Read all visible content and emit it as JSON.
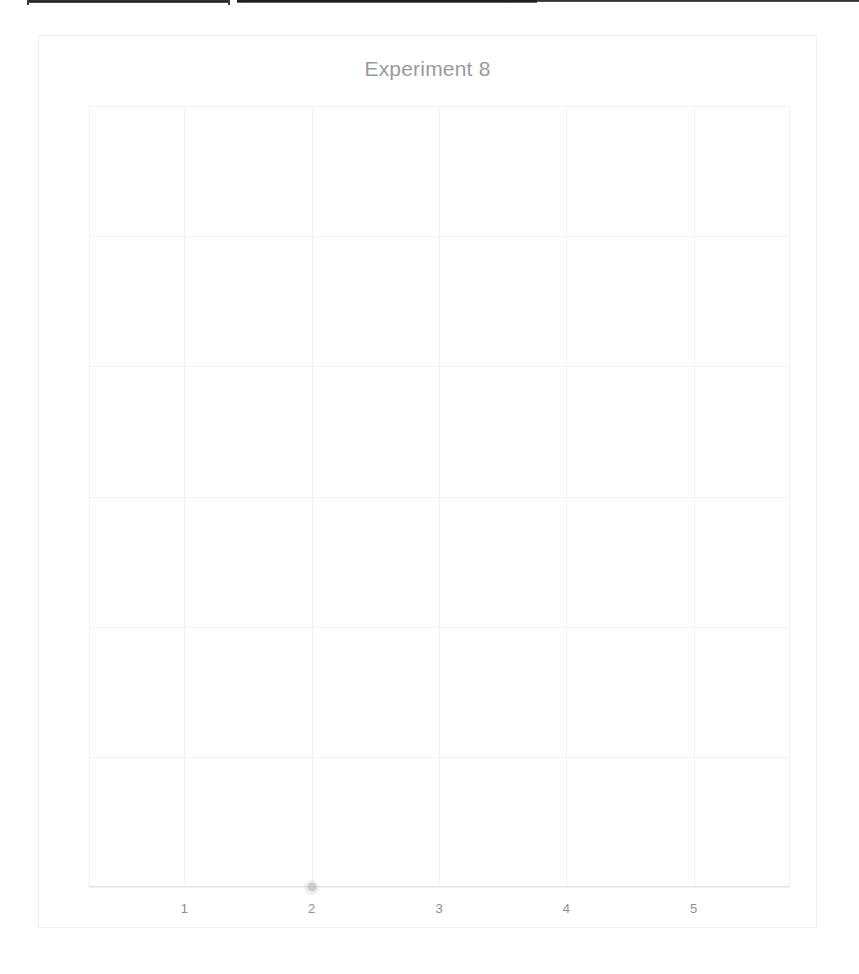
{
  "page": {
    "background_color": "#ffffff",
    "width": 859,
    "height": 974
  },
  "scan_artifacts": {
    "bar_left_label": "",
    "bar_right_label": ""
  },
  "chart_data": {
    "type": "scatter",
    "title": "Experiment 8",
    "xlabel": "",
    "ylabel": "",
    "xticklabels": [
      "1",
      "2",
      "3",
      "4",
      "5"
    ],
    "x": [
      2
    ],
    "y": [
      0
    ],
    "yticklabels": [],
    "xlim": [
      0.25,
      5.75
    ],
    "ylim": [
      0,
      6.7
    ],
    "grid": true,
    "grid_color": "#f2f2f4",
    "legend": false,
    "marker_color": "#b4b4b8",
    "title_color": "#9a9a9e",
    "tick_color": "#8e8e92",
    "frame_color": "#f0f0f2",
    "axis_color": "#e2e2e6",
    "series": [
      {
        "name": "",
        "points": [
          {
            "x": 2,
            "y": 0
          }
        ]
      }
    ],
    "x_gridline_values": [
      0.25,
      1,
      2,
      3,
      4,
      5,
      5.75
    ],
    "y_gridline_count": 7,
    "note": "Heavily faded scan; only one data point visible, sitting on the x-axis at x=2."
  }
}
